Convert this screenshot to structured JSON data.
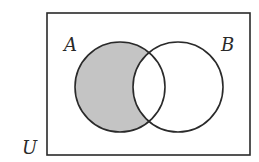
{
  "diagram": {
    "type": "venn",
    "title": "",
    "universe": {
      "label": "U",
      "x": 47,
      "y": 13,
      "width": 203,
      "height": 142
    },
    "sets": [
      {
        "label": "A",
        "cx": 120,
        "cy": 87,
        "r": 45
      },
      {
        "label": "B",
        "cx": 178,
        "cy": 87,
        "r": 45
      }
    ],
    "shaded_region": "A minus B",
    "colors": {
      "stroke": "#2a2a2a",
      "shade": "#c4c4c4",
      "background": "#ffffff"
    }
  },
  "labels": {
    "universe": "U",
    "set_a": "A",
    "set_b": "B"
  }
}
